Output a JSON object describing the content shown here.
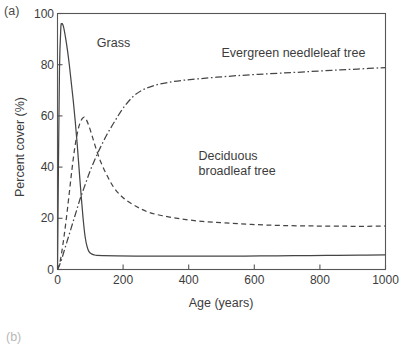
{
  "figure": {
    "panel_label": "(a)",
    "next_panel_label": "(b)"
  },
  "chart_data": {
    "type": "line",
    "title": "",
    "xlabel": "Age (years)",
    "ylabel": "Percent cover (%)",
    "xlim": [
      0,
      1000
    ],
    "ylim": [
      0,
      100
    ],
    "xticks": [
      0,
      200,
      400,
      600,
      800,
      1000
    ],
    "yticks": [
      0,
      20,
      40,
      60,
      80,
      100
    ],
    "grid": false,
    "legend_position": "inline-annotations",
    "annotations": [
      {
        "text": "Grass",
        "x": 120,
        "y": 88
      },
      {
        "text": "Evergreen needleleaf tree",
        "x": 500,
        "y": 84
      },
      {
        "text": "Deciduous\nbroadleaf tree",
        "x": 430,
        "y": 44
      }
    ],
    "series": [
      {
        "name": "Grass",
        "style": "solid",
        "color": "#454545",
        "x": [
          0,
          3,
          6,
          10,
          13,
          18,
          24,
          30,
          36,
          42,
          48,
          54,
          60,
          66,
          72,
          78,
          84,
          90,
          96,
          104,
          112,
          120,
          140,
          180,
          240,
          320,
          420,
          520,
          620,
          720,
          820,
          920,
          1000
        ],
        "y": [
          0,
          42,
          78,
          94,
          96,
          95,
          91,
          86,
          80,
          73,
          66,
          58,
          49,
          39,
          29,
          20,
          13,
          9,
          7,
          6.1,
          5.7,
          5.5,
          5.4,
          5.3,
          5.2,
          5.2,
          5.2,
          5.2,
          5.3,
          5.4,
          5.5,
          5.6,
          5.7
        ]
      },
      {
        "name": "Deciduous broadleaf tree",
        "style": "dashed",
        "color": "#454545",
        "x": [
          0,
          6,
          12,
          20,
          28,
          36,
          44,
          52,
          60,
          68,
          76,
          82,
          88,
          96,
          106,
          118,
          132,
          150,
          172,
          200,
          235,
          275,
          320,
          375,
          440,
          510,
          590,
          680,
          780,
          880,
          960,
          1000
        ],
        "y": [
          0,
          2,
          6,
          13,
          21,
          30,
          39,
          47,
          53,
          57,
          59,
          59.5,
          58.5,
          56,
          52,
          47,
          42,
          37,
          32,
          28,
          25,
          22.5,
          21,
          19.8,
          18.8,
          18.2,
          17.6,
          17.2,
          17.0,
          16.9,
          16.9,
          17.0
        ]
      },
      {
        "name": "Evergreen needleleaf tree",
        "style": "dashdot",
        "color": "#454545",
        "x": [
          0,
          10,
          22,
          34,
          46,
          58,
          70,
          84,
          98,
          114,
          132,
          152,
          175,
          200,
          230,
          262,
          298,
          338,
          382,
          430,
          485,
          545,
          610,
          680,
          755,
          835,
          915,
          1000
        ],
        "y": [
          0,
          3,
          8,
          13,
          18,
          23,
          28,
          33,
          38,
          43,
          48,
          53,
          58,
          63,
          67.5,
          70.3,
          72.0,
          73.1,
          73.9,
          74.5,
          75.1,
          75.7,
          76.2,
          76.7,
          77.2,
          77.8,
          78.3,
          78.9
        ]
      }
    ]
  }
}
